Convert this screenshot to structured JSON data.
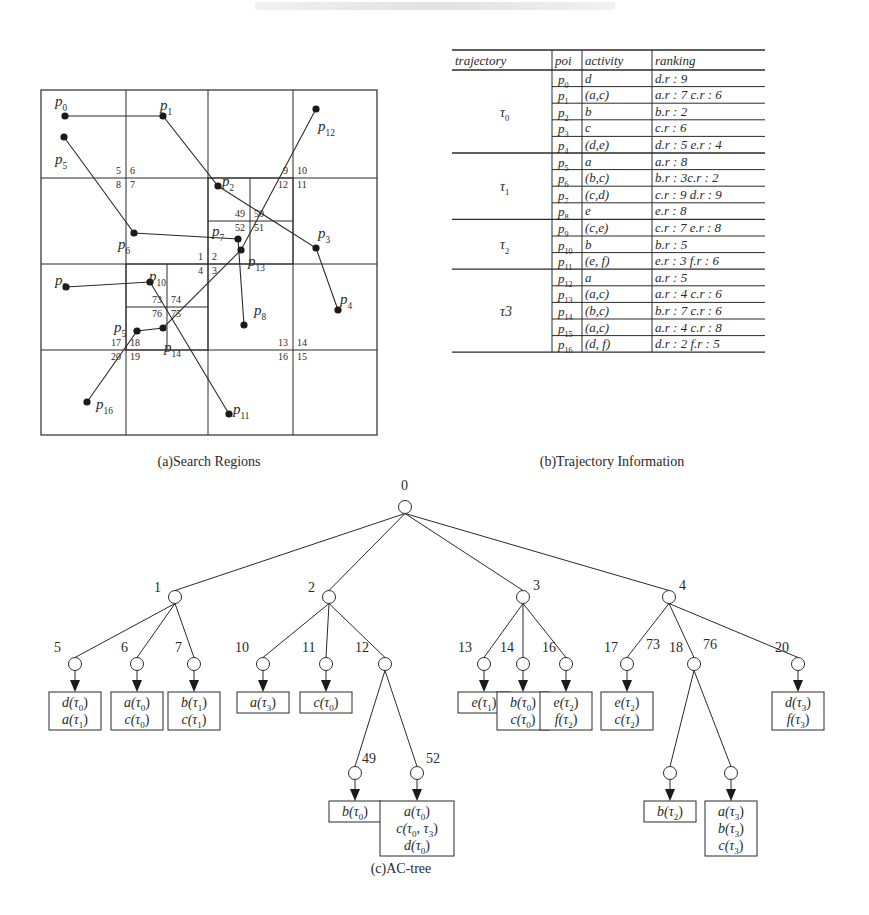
{
  "figure": {
    "panels": [
      {
        "id": "a",
        "caption": "(a)Search Regions",
        "grid": {
          "x": [
            41,
            126,
            208,
            293,
            377
          ],
          "y": [
            90,
            178,
            264,
            350,
            435
          ],
          "sub_cells": [
            {
              "x": [
                208,
                250,
                293
              ],
              "y": [
                178,
                221,
                264
              ],
              "labels": [
                "49",
                "50",
                "52",
                "51"
              ]
            },
            {
              "x": [
                126,
                167,
                208
              ],
              "y": [
                264,
                307,
                350
              ],
              "labels": [
                "73",
                "74",
                "76",
                "75"
              ]
            }
          ],
          "cell_labels": [
            {
              "text": "5",
              "x": 121,
              "y": 174
            },
            {
              "text": "6",
              "x": 130,
              "y": 174
            },
            {
              "text": "8",
              "x": 121,
              "y": 188
            },
            {
              "text": "7",
              "x": 130,
              "y": 188
            },
            {
              "text": "9",
              "x": 288,
              "y": 174
            },
            {
              "text": "10",
              "x": 297,
              "y": 174
            },
            {
              "text": "12",
              "x": 288,
              "y": 188
            },
            {
              "text": "11",
              "x": 297,
              "y": 188
            },
            {
              "text": "1",
              "x": 203,
              "y": 260
            },
            {
              "text": "2",
              "x": 212,
              "y": 260
            },
            {
              "text": "4",
              "x": 203,
              "y": 274
            },
            {
              "text": "3",
              "x": 212,
              "y": 274
            },
            {
              "text": "13",
              "x": 288,
              "y": 346
            },
            {
              "text": "14",
              "x": 297,
              "y": 346
            },
            {
              "text": "16",
              "x": 288,
              "y": 360
            },
            {
              "text": "15",
              "x": 297,
              "y": 360
            },
            {
              "text": "17",
              "x": 121,
              "y": 346
            },
            {
              "text": "18",
              "x": 130,
              "y": 346
            },
            {
              "text": "20",
              "x": 121,
              "y": 360
            },
            {
              "text": "19",
              "x": 130,
              "y": 360
            },
            {
              "text": "49",
              "x": 245,
              "y": 217
            },
            {
              "text": "50",
              "x": 254,
              "y": 217
            },
            {
              "text": "52",
              "x": 245,
              "y": 231
            },
            {
              "text": "51",
              "x": 254,
              "y": 231
            },
            {
              "text": "73",
              "x": 162,
              "y": 303
            },
            {
              "text": "74",
              "x": 171,
              "y": 303
            },
            {
              "text": "76",
              "x": 162,
              "y": 317
            },
            {
              "text": "75",
              "x": 171,
              "y": 317
            }
          ]
        },
        "points": [
          {
            "id": "p0",
            "sub": "0",
            "x": 65,
            "y": 116,
            "lx": 55,
            "ly": 106
          },
          {
            "id": "p1",
            "sub": "1",
            "x": 163,
            "y": 116,
            "lx": 160,
            "ly": 110
          },
          {
            "id": "p2",
            "sub": "2",
            "x": 218,
            "y": 186,
            "lx": 222,
            "ly": 186
          },
          {
            "id": "p3",
            "sub": "3",
            "x": 316,
            "y": 248,
            "lx": 318,
            "ly": 238
          },
          {
            "id": "p4",
            "sub": "4",
            "x": 338,
            "y": 310,
            "lx": 340,
            "ly": 304
          },
          {
            "id": "p5",
            "sub": "5",
            "x": 64,
            "y": 137,
            "lx": 55,
            "ly": 164
          },
          {
            "id": "p6",
            "sub": "6",
            "x": 134,
            "y": 233,
            "lx": 118,
            "ly": 249
          },
          {
            "id": "p7",
            "sub": "7",
            "x": 238,
            "y": 239,
            "lx": 212,
            "ly": 236
          },
          {
            "id": "p8",
            "sub": "8",
            "x": 244,
            "y": 325,
            "lx": 254,
            "ly": 315
          },
          {
            "id": "p9",
            "sub": "9",
            "x": 66,
            "y": 287,
            "lx": 55,
            "ly": 285
          },
          {
            "id": "p10",
            "sub": "10",
            "x": 150,
            "y": 282,
            "lx": 149,
            "ly": 281
          },
          {
            "id": "p11",
            "sub": "11",
            "x": 229,
            "y": 414,
            "lx": 233,
            "ly": 414
          },
          {
            "id": "p12",
            "sub": "12",
            "x": 316,
            "y": 109,
            "lx": 318,
            "ly": 131
          },
          {
            "id": "p13",
            "sub": "13",
            "x": 241,
            "y": 250,
            "lx": 248,
            "ly": 266
          },
          {
            "id": "p14",
            "sub": "14",
            "x": 163,
            "y": 328,
            "lx": 164,
            "ly": 352
          },
          {
            "id": "p15",
            "sub": "5",
            "x": 137,
            "y": 331,
            "lx": 114,
            "ly": 332
          },
          {
            "id": "p16",
            "sub": "16",
            "x": 87,
            "y": 402,
            "lx": 96,
            "ly": 409
          }
        ],
        "trajectories": [
          {
            "name": "τ0",
            "path": [
              "p0",
              "p1",
              "p2",
              "p3",
              "p4"
            ]
          },
          {
            "name": "τ1",
            "path": [
              "p5",
              "p6",
              "p7",
              "p8"
            ]
          },
          {
            "name": "τ2",
            "path": [
              "p9",
              "p10",
              "p11"
            ]
          },
          {
            "name": "τ3",
            "path": [
              "p12",
              "p13",
              "p14",
              "p15",
              "p16"
            ]
          }
        ]
      },
      {
        "id": "b",
        "caption": "(b)Trajectory Information",
        "table": {
          "headers": [
            "trajectory",
            "poi",
            "activity",
            "ranking"
          ],
          "groups": [
            {
              "trajectory": "τ",
              "trajectory_sub": "0",
              "rows": [
                {
                  "poi": "p",
                  "poi_sub": "0",
                  "activity": "d",
                  "ranking": "d.r : 9"
                },
                {
                  "poi": "p",
                  "poi_sub": "1",
                  "activity": "(a,c)",
                  "ranking": "a.r : 7 c.r : 6"
                },
                {
                  "poi": "p",
                  "poi_sub": "2",
                  "activity": "b",
                  "ranking": "b.r : 2"
                },
                {
                  "poi": "p",
                  "poi_sub": "3",
                  "activity": "c",
                  "ranking": "c.r : 6"
                },
                {
                  "poi": "p",
                  "poi_sub": "4",
                  "activity": "(d,e)",
                  "ranking": "d.r : 5 e.r : 4"
                }
              ]
            },
            {
              "trajectory": "τ",
              "trajectory_sub": "1",
              "rows": [
                {
                  "poi": "p",
                  "poi_sub": "5",
                  "activity": "a",
                  "ranking": "a.r : 8"
                },
                {
                  "poi": "p",
                  "poi_sub": "6",
                  "activity": "(b,c)",
                  "ranking": "b.r : 3c.r : 2"
                },
                {
                  "poi": "p",
                  "poi_sub": "7",
                  "activity": "(c,d)",
                  "ranking": "c.r : 9 d.r : 9"
                },
                {
                  "poi": "p",
                  "poi_sub": "8",
                  "activity": "e",
                  "ranking": "e.r : 8"
                }
              ]
            },
            {
              "trajectory": "τ",
              "trajectory_sub": "2",
              "rows": [
                {
                  "poi": "p",
                  "poi_sub": "9",
                  "activity": "(c,e)",
                  "ranking": "c.r : 7 e.r : 8"
                },
                {
                  "poi": "p",
                  "poi_sub": "10",
                  "activity": "b",
                  "ranking": "b.r : 5"
                },
                {
                  "poi": "p",
                  "poi_sub": "11",
                  "activity": "(e, f)",
                  "ranking": "e.r : 3 f.r : 6"
                }
              ]
            },
            {
              "trajectory": "τ3",
              "trajectory_sub": "",
              "rows": [
                {
                  "poi": "p",
                  "poi_sub": "12",
                  "activity": "a",
                  "ranking": "a.r : 5"
                },
                {
                  "poi": "p",
                  "poi_sub": "13",
                  "activity": "(a,c)",
                  "ranking": "a.r : 4 c.r : 6"
                },
                {
                  "poi": "p",
                  "poi_sub": "14",
                  "activity": "(b,c)",
                  "ranking": "b.r : 7 c.r : 6"
                },
                {
                  "poi": "p",
                  "poi_sub": "15",
                  "activity": "(a,c)",
                  "ranking": "a.r : 4 c.r : 8"
                },
                {
                  "poi": "p",
                  "poi_sub": "16",
                  "activity": "(d, f)",
                  "ranking": "d.r : 2 f.r : 5"
                }
              ]
            }
          ]
        }
      },
      {
        "id": "c",
        "caption": "(c)AC-tree",
        "nodes": [
          {
            "id": "0",
            "x": 405,
            "y": 507,
            "lx": 401,
            "ly": 490
          },
          {
            "id": "1",
            "x": 175,
            "y": 597,
            "lx": 154,
            "ly": 592
          },
          {
            "id": "2",
            "x": 329,
            "y": 597,
            "lx": 308,
            "ly": 592
          },
          {
            "id": "3",
            "x": 523,
            "y": 597,
            "lx": 533,
            "ly": 590
          },
          {
            "id": "4",
            "x": 669,
            "y": 597,
            "lx": 679,
            "ly": 590
          },
          {
            "id": "5",
            "x": 75,
            "y": 664,
            "lx": 54,
            "ly": 652
          },
          {
            "id": "6",
            "x": 137,
            "y": 664,
            "lx": 121,
            "ly": 652
          },
          {
            "id": "7",
            "x": 194,
            "y": 664,
            "lx": 175,
            "ly": 652
          },
          {
            "id": "10",
            "x": 263,
            "y": 664,
            "lx": 235,
            "ly": 652
          },
          {
            "id": "11",
            "x": 326,
            "y": 664,
            "lx": 302,
            "ly": 652
          },
          {
            "id": "12",
            "x": 385,
            "y": 664,
            "lx": 355,
            "ly": 652
          },
          {
            "id": "13",
            "x": 484,
            "y": 664,
            "lx": 458,
            "ly": 652
          },
          {
            "id": "14",
            "x": 523,
            "y": 664,
            "lx": 500,
            "ly": 652
          },
          {
            "id": "16",
            "x": 566,
            "y": 664,
            "lx": 542,
            "ly": 652
          },
          {
            "id": "17",
            "x": 627,
            "y": 664,
            "lx": 604,
            "ly": 652
          },
          {
            "id": "18",
            "x": 694,
            "y": 664,
            "lx": 669,
            "ly": 652
          },
          {
            "id": "20",
            "x": 798,
            "y": 664,
            "lx": 775,
            "ly": 652
          },
          {
            "id": "49",
            "x": 355,
            "y": 773,
            "lx": 362,
            "ly": 763
          },
          {
            "id": "52",
            "x": 417,
            "y": 773,
            "lx": 426,
            "ly": 763
          },
          {
            "id": "73",
            "x": 670,
            "y": 773,
            "lx": 646,
            "ly": 649
          },
          {
            "id": "76",
            "x": 731,
            "y": 773,
            "lx": 703,
            "ly": 649
          }
        ],
        "edges": [
          [
            "0",
            "1"
          ],
          [
            "0",
            "2"
          ],
          [
            "0",
            "3"
          ],
          [
            "0",
            "4"
          ],
          [
            "1",
            "5"
          ],
          [
            "1",
            "6"
          ],
          [
            "1",
            "7"
          ],
          [
            "2",
            "10"
          ],
          [
            "2",
            "11"
          ],
          [
            "2",
            "12"
          ],
          [
            "3",
            "13"
          ],
          [
            "3",
            "14"
          ],
          [
            "3",
            "16"
          ],
          [
            "4",
            "17"
          ],
          [
            "4",
            "18"
          ],
          [
            "4",
            "20"
          ],
          [
            "12",
            "49"
          ],
          [
            "12",
            "52"
          ],
          [
            "18",
            "73"
          ],
          [
            "18",
            "76"
          ]
        ],
        "leaf_boxes": [
          {
            "node": "5",
            "entries": [
              [
                "d",
                "0"
              ],
              [
                "a",
                "1"
              ]
            ]
          },
          {
            "node": "6",
            "entries": [
              [
                "a",
                "0"
              ],
              [
                "c",
                "0"
              ]
            ]
          },
          {
            "node": "7",
            "entries": [
              [
                "b",
                "1"
              ],
              [
                "c",
                "1"
              ]
            ]
          },
          {
            "node": "10",
            "entries": [
              [
                "a",
                "3"
              ]
            ]
          },
          {
            "node": "11",
            "entries": [
              [
                "c",
                "0"
              ]
            ]
          },
          {
            "node": "13",
            "entries": [
              [
                "e",
                "1"
              ]
            ]
          },
          {
            "node": "14",
            "entries": [
              [
                "b",
                "0"
              ],
              [
                "c",
                "0"
              ]
            ]
          },
          {
            "node": "16",
            "entries": [
              [
                "e",
                "2"
              ],
              [
                "f",
                "2"
              ]
            ]
          },
          {
            "node": "17",
            "entries": [
              [
                "e",
                "2"
              ],
              [
                "c",
                "2"
              ]
            ]
          },
          {
            "node": "20",
            "entries": [
              [
                "d",
                "3"
              ],
              [
                "f",
                "3"
              ]
            ]
          },
          {
            "node": "49",
            "entries": [
              [
                "b",
                "0"
              ]
            ]
          },
          {
            "node": "52",
            "entries": [
              [
                "a",
                "0"
              ],
              [
                "c",
                "0,3"
              ],
              [
                "d",
                "0"
              ]
            ]
          },
          {
            "node": "73",
            "entries": [
              [
                "b",
                "2"
              ]
            ]
          },
          {
            "node": "76",
            "entries": [
              [
                "a",
                "3"
              ],
              [
                "b",
                "3"
              ],
              [
                "c",
                "3"
              ]
            ]
          }
        ]
      }
    ],
    "colors": {
      "ink": "#2a2a2a",
      "background": "#ffffff"
    }
  }
}
